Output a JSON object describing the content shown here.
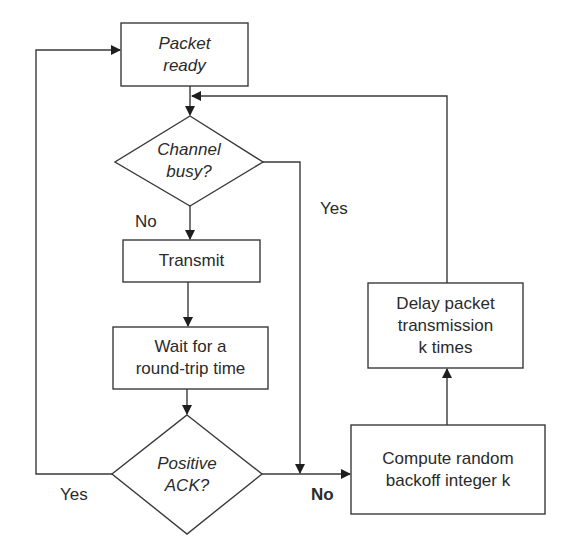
{
  "diagram": {
    "type": "flowchart",
    "nodes": {
      "packet_ready": {
        "shape": "rectangle",
        "line1": "Packet",
        "line2": "ready"
      },
      "channel_busy": {
        "shape": "diamond",
        "line1": "Channel",
        "line2": "busy?"
      },
      "transmit": {
        "shape": "rectangle",
        "line1": "Transmit"
      },
      "wait": {
        "shape": "rectangle",
        "line1": "Wait for a",
        "line2": "round-trip time"
      },
      "positive_ack": {
        "shape": "diamond",
        "line1": "Positive",
        "line2": "ACK?"
      },
      "compute_backoff": {
        "shape": "rectangle",
        "line1": "Compute random",
        "line2": "backoff integer k"
      },
      "delay": {
        "shape": "rectangle",
        "line1": "Delay packet",
        "line2": "transmission",
        "line3": "k times"
      }
    },
    "edge_labels": {
      "channel_no": "No",
      "channel_yes": "Yes",
      "ack_yes": "Yes",
      "ack_no": "No"
    },
    "edges": [
      {
        "from": "packet_ready",
        "to": "channel_busy"
      },
      {
        "from": "channel_busy",
        "to": "transmit",
        "label": "No"
      },
      {
        "from": "channel_busy",
        "to": "compute_backoff",
        "label": "Yes"
      },
      {
        "from": "transmit",
        "to": "wait"
      },
      {
        "from": "wait",
        "to": "positive_ack"
      },
      {
        "from": "positive_ack",
        "to": "packet_ready",
        "label": "Yes"
      },
      {
        "from": "positive_ack",
        "to": "compute_backoff",
        "label": "No"
      },
      {
        "from": "compute_backoff",
        "to": "delay"
      },
      {
        "from": "delay",
        "to": "channel_busy"
      }
    ],
    "colors": {
      "stroke": "#3a3a3a",
      "text": "#2a2a2a",
      "background": "#ffffff"
    }
  }
}
